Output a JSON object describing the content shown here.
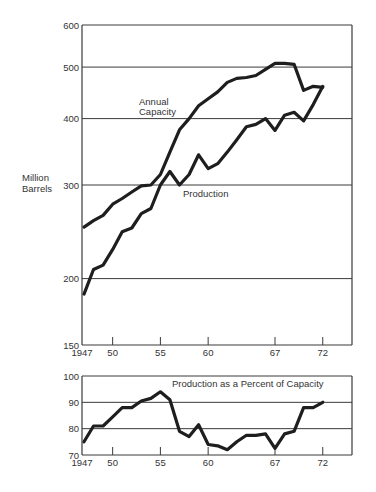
{
  "chart_data": [
    {
      "type": "line",
      "title": "",
      "xlabel": "",
      "ylabel": "Million Barrels",
      "yscale": "log",
      "ylim": [
        150,
        600
      ],
      "xlim": [
        1947,
        1975
      ],
      "grid": true,
      "y_ticks": [
        150,
        200,
        300,
        400,
        500,
        600
      ],
      "x_ticks": [
        1947,
        1950,
        1955,
        1960,
        1967,
        1972
      ],
      "x_tick_labels": [
        "1947",
        "50",
        "55",
        "60",
        "67",
        "72"
      ],
      "x": [
        1947,
        1948,
        1949,
        1950,
        1951,
        1952,
        1953,
        1954,
        1955,
        1956,
        1957,
        1958,
        1959,
        1960,
        1961,
        1962,
        1963,
        1964,
        1965,
        1966,
        1967,
        1968,
        1969,
        1970,
        1971,
        1972
      ],
      "series": [
        {
          "name": "Annual Capacity",
          "label_lines": [
            "Annual",
            "Capacity"
          ],
          "values": [
            250,
            257,
            263,
            276,
            283,
            291,
            299,
            300,
            314,
            346,
            381,
            400,
            423,
            436,
            449,
            468,
            476,
            478,
            482,
            495,
            508,
            508,
            506,
            452,
            460,
            458
          ]
        },
        {
          "name": "Production",
          "label_lines": [
            "Production"
          ],
          "values": [
            187,
            208,
            212,
            227,
            245,
            249,
            265,
            271,
            300,
            318,
            300,
            314,
            342,
            322,
            329,
            346,
            365,
            386,
            390,
            400,
            380,
            406,
            411,
            396,
            425,
            460
          ]
        }
      ]
    },
    {
      "type": "line",
      "title": "Production as a Percent of Capacity",
      "xlabel": "",
      "ylabel": "",
      "ylim": [
        70,
        100
      ],
      "xlim": [
        1947,
        1975
      ],
      "grid": true,
      "y_ticks": [
        70,
        80,
        90,
        100
      ],
      "x_ticks": [
        1947,
        1950,
        1955,
        1960,
        1967,
        1972
      ],
      "x_tick_labels": [
        "1947",
        "50",
        "55",
        "60",
        "67",
        "72"
      ],
      "x": [
        1947,
        1948,
        1949,
        1950,
        1951,
        1952,
        1953,
        1954,
        1955,
        1956,
        1957,
        1958,
        1959,
        1960,
        1961,
        1962,
        1963,
        1964,
        1965,
        1966,
        1967,
        1968,
        1969,
        1970,
        1971,
        1972
      ],
      "series": [
        {
          "name": "Production as a Percent of Capacity",
          "values": [
            75,
            81,
            81,
            84.5,
            88,
            88,
            90.5,
            91.5,
            94,
            91,
            79,
            77,
            81.5,
            74,
            73.5,
            72,
            75,
            77.5,
            77.5,
            78,
            72.5,
            78,
            79,
            88,
            88,
            90
          ]
        }
      ]
    }
  ],
  "style": {
    "line_color": "#1e1e1e",
    "grid_color": "#3a3a3a",
    "text_color": "#333333",
    "background": "#ffffff"
  }
}
